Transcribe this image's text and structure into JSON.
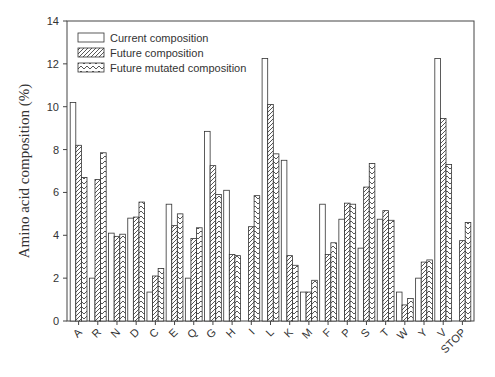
{
  "chart_data": {
    "type": "bar",
    "title": "",
    "xlabel": "",
    "ylabel": "Amino acid composition (%)",
    "ylim": [
      0,
      14
    ],
    "yticks": [
      0,
      2,
      4,
      6,
      8,
      10,
      12,
      14
    ],
    "grid": false,
    "legend_position": "upper-left",
    "categories": [
      "A",
      "R",
      "N",
      "D",
      "C",
      "E",
      "Q",
      "G",
      "H",
      "I",
      "L",
      "K",
      "M",
      "F",
      "P",
      "S",
      "T",
      "W",
      "Y",
      "V",
      "STOP"
    ],
    "series": [
      {
        "name": "Current composition",
        "pattern": "none",
        "values": [
          10.2,
          2.0,
          4.1,
          4.8,
          1.35,
          5.45,
          2.0,
          8.85,
          6.1,
          0,
          12.25,
          7.5,
          1.35,
          5.45,
          4.75,
          3.4,
          4.75,
          1.35,
          2.0,
          12.25,
          0
        ]
      },
      {
        "name": "Future composition",
        "pattern": "diagonal-hatch",
        "values": [
          8.2,
          6.6,
          3.95,
          4.85,
          2.1,
          4.45,
          3.85,
          7.25,
          3.1,
          4.4,
          10.1,
          3.05,
          1.35,
          3.1,
          5.5,
          6.25,
          5.15,
          0.75,
          2.75,
          9.45,
          3.75
        ]
      },
      {
        "name": "Future mutated composition",
        "pattern": "chevron-hatch",
        "values": [
          6.7,
          7.85,
          4.05,
          5.55,
          2.45,
          5.0,
          4.35,
          5.9,
          3.05,
          5.85,
          7.8,
          2.6,
          1.9,
          3.65,
          5.45,
          7.35,
          4.7,
          1.05,
          2.85,
          7.3,
          4.6
        ]
      }
    ]
  },
  "legend": {
    "items": [
      "Current composition",
      "Future composition",
      "Future mutated composition"
    ]
  },
  "axis": {
    "ylabel": "Amino acid composition (%)"
  }
}
